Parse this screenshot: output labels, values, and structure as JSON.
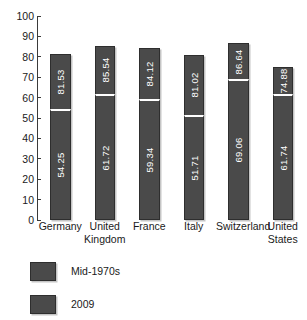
{
  "chart_data": {
    "type": "bar",
    "subtype": "stacked-bar",
    "title": "",
    "subtitle": "",
    "xlabel": "",
    "ylabel": "",
    "ylim": [
      0,
      100
    ],
    "ytick_labels": [
      "100",
      "90",
      "80",
      "70",
      "60",
      "50",
      "40",
      "30",
      "20",
      "10",
      "0"
    ],
    "ytick_values": [
      100,
      90,
      80,
      70,
      60,
      50,
      40,
      30,
      20,
      10,
      0
    ],
    "grid": false,
    "legend_position": "bottom-left",
    "categories": [
      "Germany",
      "United Kingdom",
      "France",
      "Italy",
      "Switzerland",
      "United States"
    ],
    "category_lines": [
      [
        "Germany"
      ],
      [
        "United",
        "Kingdom"
      ],
      [
        "France"
      ],
      [
        "Italy"
      ],
      [
        "Switzerland"
      ],
      [
        "United",
        "States"
      ]
    ],
    "series": [
      {
        "name": "Mid-1970s",
        "color": "#4a4a4a",
        "values": [
          54.25,
          61.72,
          59.34,
          51.71,
          69.06,
          61.74
        ],
        "labels": [
          "54.25",
          "61.72",
          "59.34",
          "51.71",
          "69.06",
          "61.74"
        ]
      },
      {
        "name": "2009",
        "color": "#4a4a4a",
        "values": [
          81.53,
          85.54,
          84.12,
          81.02,
          86.64,
          74.88
        ],
        "labels": [
          "81.53",
          "85.54",
          "84.12",
          "81.02",
          "86.64",
          "74.88"
        ],
        "note": "top of stacked bar (total height)"
      }
    ],
    "legend": [
      {
        "label": "Mid-1970s",
        "color": "#4a4a4a"
      },
      {
        "label": "2009",
        "color": "#4a4a4a"
      }
    ]
  },
  "colors": {
    "bar_fill": "#4a4a4a",
    "bar_border": "#2e2e2e",
    "segment_divider": "#ffffff",
    "axis": "#3a3a3a",
    "text": "#1a1a1a",
    "value_text": "#ffffff",
    "background": "#ffffff"
  }
}
